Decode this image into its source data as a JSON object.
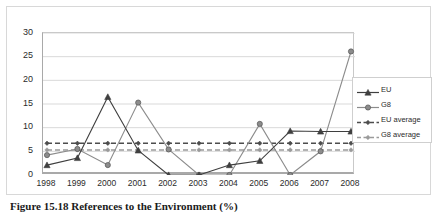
{
  "caption": "Figure 15.18 References to the Environment (%)",
  "legend": {
    "position": "right-inside",
    "items": [
      {
        "label": "EU",
        "key": "line-solid-triangle",
        "color": "#4d4d4d"
      },
      {
        "label": "G8",
        "key": "line-solid-circle",
        "color": "#8a8a8a"
      },
      {
        "label": "EU average",
        "key": "line-dashed-diamond",
        "color": "#4d4d4d"
      },
      {
        "label": "G8 average",
        "key": "line-dashed-diamond",
        "color": "#9a9a9a"
      }
    ]
  },
  "chart_data": {
    "type": "line",
    "title": "",
    "xlabel": "",
    "ylabel": "",
    "categories": [
      "1998",
      "1999",
      "2000",
      "2001",
      "2002",
      "2003",
      "2004",
      "2005",
      "2006",
      "2007",
      "2008"
    ],
    "ylim": [
      0,
      30
    ],
    "yticks": [
      0,
      5,
      10,
      15,
      20,
      25,
      30
    ],
    "grid": true,
    "series": [
      {
        "name": "EU",
        "marker": "triangle",
        "style": "solid",
        "color": "#3f3f3f",
        "values": [
          2.1,
          3.6,
          16.5,
          5.2,
          0.0,
          0.0,
          2.1,
          3.0,
          9.3,
          9.2,
          9.2
        ]
      },
      {
        "name": "G8",
        "marker": "circle",
        "style": "solid",
        "color": "#8c8c8c",
        "values": [
          4.2,
          5.5,
          2.1,
          15.3,
          5.4,
          0.0,
          0.0,
          10.8,
          0.0,
          5.0,
          26.1
        ]
      },
      {
        "name": "EU average",
        "marker": "diamond",
        "style": "dashed",
        "color": "#4d4d4d",
        "constant": 6.7,
        "values": [
          6.7,
          6.7,
          6.7,
          6.7,
          6.7,
          6.7,
          6.7,
          6.7,
          6.7,
          6.7,
          6.7
        ]
      },
      {
        "name": "G8 average",
        "marker": "diamond",
        "style": "dashed",
        "color": "#9a9a9a",
        "constant": 5.3,
        "values": [
          5.3,
          5.3,
          5.3,
          5.3,
          5.3,
          5.3,
          5.3,
          5.3,
          5.3,
          5.3,
          5.3
        ]
      }
    ]
  }
}
